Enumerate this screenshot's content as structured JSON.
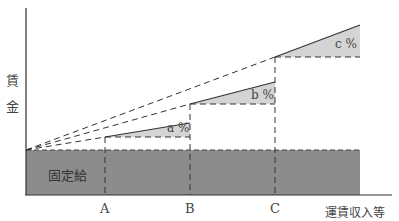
{
  "diagram": {
    "y_axis_label_1": "賃",
    "y_axis_label_2": "金",
    "x_axis_label": "運賃収入等",
    "fixed_pay_label": "固定給",
    "tick_a": "A",
    "tick_b": "B",
    "tick_c": "C",
    "rate_a": "a %",
    "rate_b": "b %",
    "rate_c": "c %",
    "colors": {
      "fixed_pay_fill": "#8c8c8c",
      "rate_fill": "#d4d4d4",
      "line": "#333333"
    }
  }
}
